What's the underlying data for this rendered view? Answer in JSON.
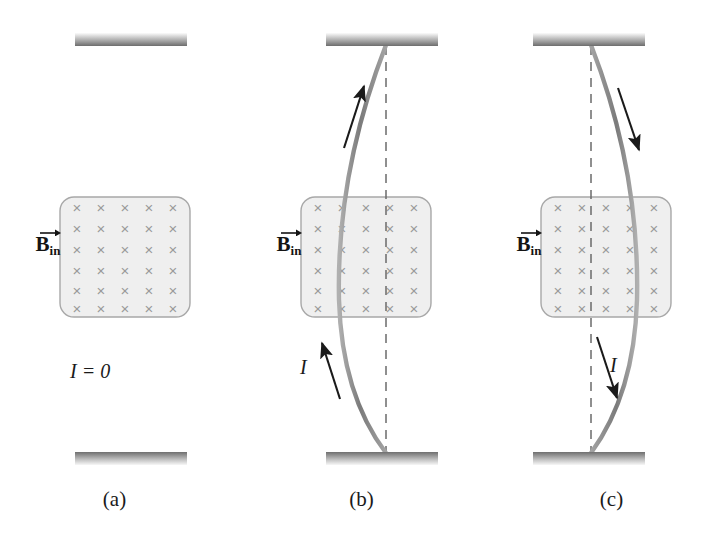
{
  "figure": {
    "background_color": "#ffffff"
  },
  "style": {
    "wire_color": "#8a8a8a",
    "wire_width": 4,
    "support_color_top": "#f2f2f2",
    "support_color_bottom": "#6e6e6e",
    "field_box_fill": "#efefef",
    "field_box_stroke": "#a8a8a8",
    "cross_color": "#9a9a9a",
    "arrow_color": "#1a1a1a",
    "dashed_color": "#6b6b6b",
    "label_color": "#141414"
  },
  "field_box": {
    "cross_glyph": "×",
    "columns": 5,
    "rows": 6,
    "x": 60,
    "y": 197,
    "width": 130,
    "height": 120,
    "corner_radius": 14
  },
  "panels": [
    {
      "id": "a",
      "caption": "(a)",
      "field_label": {
        "symbol": "B",
        "subscript": "in",
        "vector_arrow": true
      },
      "current": {
        "label": "I = 0",
        "value": 0,
        "direction": "none",
        "arrows": []
      },
      "wire": {
        "shape": "straight",
        "deflection_px": 0,
        "top_anchor_x": 125,
        "bottom_anchor_x": 125,
        "description": "Straight vertical wire, no deflection"
      },
      "dashed_reference_line": false,
      "supports": {
        "top": {
          "x": 75,
          "y": 33,
          "width": 112,
          "height": 13
        },
        "bottom": {
          "x": 75,
          "y": 452,
          "width": 112,
          "height": 13
        }
      }
    },
    {
      "id": "b",
      "caption": "(b)",
      "field_label": {
        "symbol": "B",
        "subscript": "in",
        "vector_arrow": true
      },
      "current": {
        "label": "I",
        "direction": "up",
        "arrows": [
          {
            "name": "upper-current-arrow",
            "x1": 103,
            "y1": 148,
            "x2": 122,
            "y2": 84
          },
          {
            "name": "lower-current-arrow",
            "x1": 99,
            "y1": 399,
            "x2": 80,
            "y2": 341
          }
        ]
      },
      "wire": {
        "shape": "bowed-left",
        "deflection_px": -40,
        "top_anchor_x": 145,
        "bottom_anchor_x": 145,
        "description": "Wire bows to the left away from the dashed reference line"
      },
      "dashed_reference_line": true,
      "supports": {
        "top": {
          "x": 85,
          "y": 33,
          "width": 112,
          "height": 13
        },
        "bottom": {
          "x": 85,
          "y": 452,
          "width": 112,
          "height": 13
        }
      }
    },
    {
      "id": "c",
      "caption": "(c)",
      "field_label": {
        "symbol": "B",
        "subscript": "in",
        "vector_arrow": true
      },
      "current": {
        "label": "I",
        "direction": "down",
        "arrows": [
          {
            "name": "upper-current-arrow",
            "x1": 137,
            "y1": 88,
            "x2": 158,
            "y2": 151
          },
          {
            "name": "lower-current-arrow",
            "x1": 116,
            "y1": 337,
            "x2": 136,
            "y2": 399
          }
        ]
      },
      "wire": {
        "shape": "bowed-right",
        "deflection_px": 40,
        "top_anchor_x": 110,
        "bottom_anchor_x": 110,
        "description": "Wire bows to the right away from the dashed reference line"
      },
      "dashed_reference_line": true,
      "supports": {
        "top": {
          "x": 52,
          "y": 33,
          "width": 112,
          "height": 13
        },
        "bottom": {
          "x": 52,
          "y": 452,
          "width": 112,
          "height": 13
        }
      }
    }
  ]
}
